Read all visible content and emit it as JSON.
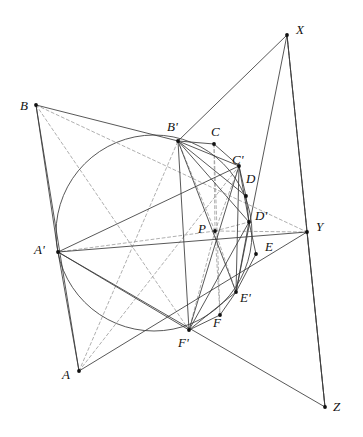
{
  "figure": {
    "kind": "geometry-diagram",
    "width": 363,
    "height": 437,
    "background_color": "#ffffff",
    "stroke_color": "#3a3a3a",
    "dash_color": "#9a9a9a",
    "point_color": "#111111",
    "circle": {
      "name": "main-circle",
      "cx": 154,
      "cy": 233,
      "r": 98
    },
    "points": [
      {
        "id": "A",
        "label": "A",
        "x": 79,
        "y": 371,
        "label_x": 62,
        "label_y": 368
      },
      {
        "id": "B",
        "label": "B",
        "x": 36,
        "y": 105,
        "label_x": 20,
        "label_y": 99
      },
      {
        "id": "Ap",
        "label": "A'",
        "x": 58,
        "y": 252,
        "label_x": 34,
        "label_y": 243
      },
      {
        "id": "Bp",
        "label": "B'",
        "x": 178,
        "y": 141,
        "label_x": 167,
        "label_y": 120
      },
      {
        "id": "C",
        "label": "C",
        "x": 214,
        "y": 144,
        "label_x": 211,
        "label_y": 125
      },
      {
        "id": "Cp",
        "label": "C'",
        "x": 239,
        "y": 166,
        "label_x": 232,
        "label_y": 153
      },
      {
        "id": "D",
        "label": "D",
        "x": 246,
        "y": 196,
        "label_x": 246,
        "label_y": 172
      },
      {
        "id": "Dp",
        "label": "D'",
        "x": 249,
        "y": 222,
        "label_x": 255,
        "label_y": 209
      },
      {
        "id": "E",
        "label": "E",
        "x": 256,
        "y": 254,
        "label_x": 265,
        "label_y": 240
      },
      {
        "id": "Ep",
        "label": "E'",
        "x": 236,
        "y": 292,
        "label_x": 240,
        "label_y": 291
      },
      {
        "id": "F",
        "label": "F",
        "x": 220,
        "y": 315,
        "label_x": 213,
        "label_y": 316
      },
      {
        "id": "Fp",
        "label": "F'",
        "x": 189,
        "y": 330,
        "label_x": 178,
        "label_y": 336
      },
      {
        "id": "P",
        "label": "P",
        "x": 215,
        "y": 231,
        "label_x": 198,
        "label_y": 222
      },
      {
        "id": "X",
        "label": "X",
        "x": 287,
        "y": 35,
        "label_x": 296,
        "label_y": 23
      },
      {
        "id": "Y",
        "label": "Y",
        "x": 307,
        "y": 232,
        "label_x": 316,
        "label_y": 220
      },
      {
        "id": "Z",
        "label": "Z",
        "x": 325,
        "y": 407,
        "label_x": 333,
        "label_y": 400
      }
    ],
    "solid_segments": [
      [
        "B",
        "Bp"
      ],
      [
        "Bp",
        "X"
      ],
      [
        "B",
        "A"
      ],
      [
        "A",
        "Ap"
      ],
      [
        "Ap",
        "B"
      ],
      [
        "X",
        "Z"
      ],
      [
        "X",
        "Y"
      ],
      [
        "Y",
        "Z"
      ],
      [
        "Ap",
        "Y"
      ],
      [
        "Ap",
        "Z"
      ],
      [
        "Bp",
        "C"
      ],
      [
        "C",
        "Cp"
      ],
      [
        "Bp",
        "Cp"
      ],
      [
        "Cp",
        "D"
      ],
      [
        "D",
        "Dp"
      ],
      [
        "Cp",
        "Dp"
      ],
      [
        "Dp",
        "E"
      ],
      [
        "E",
        "Ep"
      ],
      [
        "Dp",
        "Ep"
      ],
      [
        "Ep",
        "F"
      ],
      [
        "F",
        "Fp"
      ],
      [
        "Ep",
        "Fp"
      ],
      [
        "Bp",
        "D"
      ],
      [
        "Bp",
        "Dp"
      ],
      [
        "Bp",
        "Ep"
      ],
      [
        "Bp",
        "Fp"
      ],
      [
        "Cp",
        "Ep"
      ],
      [
        "Cp",
        "Fp"
      ],
      [
        "Dp",
        "Fp"
      ],
      [
        "Ap",
        "Cp"
      ],
      [
        "Ap",
        "Fp"
      ],
      [
        "X",
        "Ep"
      ],
      [
        "A",
        "Y"
      ]
    ],
    "dashed_segments": [
      [
        "B",
        "Y"
      ],
      [
        "B",
        "Fp"
      ],
      [
        "A",
        "Bp"
      ],
      [
        "A",
        "Cp"
      ],
      [
        "X",
        "Z"
      ],
      [
        "P",
        "Bp"
      ],
      [
        "P",
        "Ap"
      ],
      [
        "P",
        "C"
      ],
      [
        "P",
        "F"
      ],
      [
        "P",
        "Y"
      ],
      [
        "P",
        "Dp"
      ],
      [
        "P",
        "Ep"
      ],
      [
        "P",
        "Cp"
      ],
      [
        "P",
        "Fp"
      ],
      [
        "C",
        "F"
      ],
      [
        "Y",
        "Z"
      ]
    ],
    "point_marker_radius": 1.9
  }
}
